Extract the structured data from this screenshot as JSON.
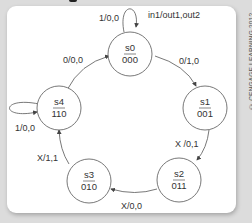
{
  "diagram": {
    "type": "finite-state-machine",
    "legend": "in1/out1,out2",
    "states": [
      {
        "id": "s0",
        "code": "000"
      },
      {
        "id": "s1",
        "code": "001"
      },
      {
        "id": "s2",
        "code": "011"
      },
      {
        "id": "s3",
        "code": "010"
      },
      {
        "id": "s4",
        "code": "110"
      }
    ],
    "transitions": [
      {
        "from": "s0",
        "to": "s0",
        "label": "1/0,0"
      },
      {
        "from": "s0",
        "to": "s1",
        "label": "0/1,0"
      },
      {
        "from": "s1",
        "to": "s2",
        "label": "X /0,1"
      },
      {
        "from": "s2",
        "to": "s3",
        "label": "X/0,0"
      },
      {
        "from": "s3",
        "to": "s4",
        "label": "X/1,1"
      },
      {
        "from": "s4",
        "to": "s4",
        "label": "1/0,0"
      },
      {
        "from": "s4",
        "to": "s0",
        "label": "0/0,0"
      }
    ]
  },
  "copyright": "© CENGAGE LEARNING 2012",
  "colors": {
    "line": "#444444",
    "text": "#333333",
    "background": "#ffffff",
    "page": "#dcdcdc"
  }
}
